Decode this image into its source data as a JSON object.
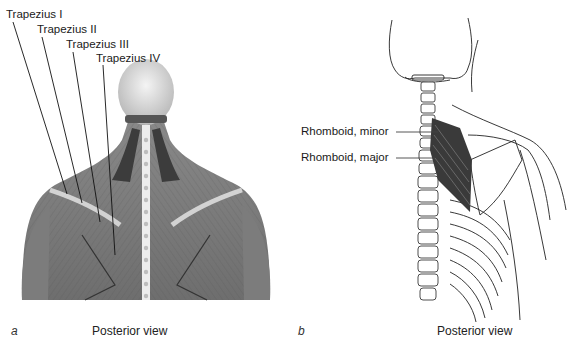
{
  "figure": {
    "panels": [
      {
        "letter": "a",
        "caption": "Posterior view",
        "labels": [
          {
            "text": "Trapezius I"
          },
          {
            "text": "Trapezius II"
          },
          {
            "text": "Trapezius III"
          },
          {
            "text": "Trapezius IV"
          }
        ]
      },
      {
        "letter": "b",
        "caption": "Posterior view",
        "labels": [
          {
            "text": "Rhomboid, minor"
          },
          {
            "text": "Rhomboid, major"
          }
        ]
      }
    ]
  }
}
